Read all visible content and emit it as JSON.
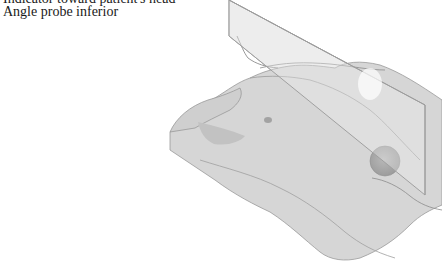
{
  "captions": {
    "line1": "Indicator toward patient's head",
    "line2": "Angle probe inferior"
  },
  "illustration": {
    "subject": "torso-with-ultrasound-scan-plane",
    "colors": {
      "skin_fill": "#d9d9d9",
      "skin_shadow": "#bfbfbf",
      "outline": "#8c8c8c",
      "plane_fill": "#e6e6e6",
      "plane_edge": "#a6a6a6",
      "organ": "#a8a8a8",
      "nipple": "#9a9a9a"
    }
  }
}
